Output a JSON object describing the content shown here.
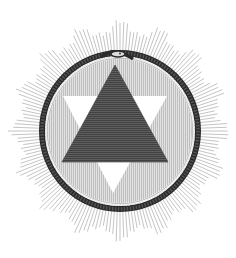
{
  "image": {
    "caption": "Engraving: ouroboros serpent encircling a hexagram (dark upward triangle over white downward triangle) within a radiating sunburst",
    "width": 236,
    "height": 258
  },
  "colors": {
    "background": "#ffffff",
    "ray": "#6e6e6e",
    "ring_dark": "#2a2a2a",
    "ring_scale": "#e8e8e8",
    "inner_disc": "#d9d9d9",
    "inner_hatch": "#9a9a9a",
    "dark_triangle": "#5a5a5a",
    "dark_triangle_hatch": "#3a3a3a",
    "white_triangle": "#ffffff"
  },
  "geometry": {
    "center": [
      120,
      131
    ],
    "ring_radius": 77,
    "ring_width": 6,
    "inner_radius": 72,
    "ray_inner": 74,
    "ray_outer_min": 95,
    "ray_outer_max": 118,
    "ray_count": 180,
    "ray_points": 16,
    "serpent_head": [
      115,
      54
    ],
    "dark_triangle": [
      [
        115,
        65
      ],
      [
        62,
        162
      ],
      [
        168,
        162
      ]
    ],
    "white_triangle": [
      [
        63,
        96
      ],
      [
        167,
        96
      ],
      [
        113,
        193
      ]
    ]
  }
}
